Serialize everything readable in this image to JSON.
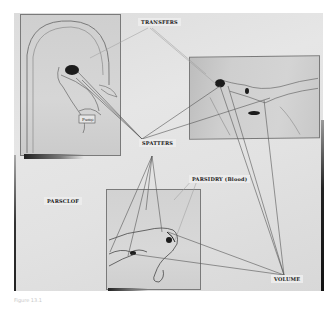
{
  "photo": {
    "subject": "board with three pinned sketches connected by strings to category labels",
    "labels": {
      "transfers": "TRANSFERS",
      "spatters": "SPATTERS",
      "parsidry": "PARSIDRY (Blood)",
      "parsclof": "PARSCLOF",
      "volume": "VOLUME"
    },
    "drawings": [
      {
        "id": "arch-figure-sketch",
        "note_tag": "Pump"
      },
      {
        "id": "reclining-figure-sketch"
      },
      {
        "id": "lying-figure-sketch"
      }
    ],
    "caption": "Figure 13.1"
  },
  "colors": {
    "board": "#e0e0e0",
    "string": "#555555",
    "faint_string": "#9a9a9a",
    "stain": "#1a1a1a"
  }
}
